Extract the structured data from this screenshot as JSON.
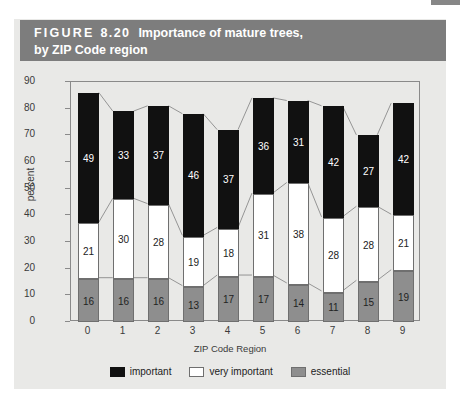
{
  "page_marker": {
    "name": "page-edge-marker",
    "color": "#878787"
  },
  "figure": {
    "label": "FIGURE",
    "number": "8.20",
    "title_line1": "Importance of mature trees,",
    "title_line2": "by ZIP Code region",
    "header_bg": "#7d7d7d",
    "panel_bg": "#e9e9e7"
  },
  "chart_data": {
    "type": "bar",
    "subtype": "stacked-vertical",
    "title": "Importance of mature trees, by ZIP Code region",
    "xlabel": "ZIP Code Region",
    "ylabel": "percent",
    "categories": [
      "0",
      "1",
      "2",
      "3",
      "4",
      "5",
      "6",
      "7",
      "8",
      "9"
    ],
    "ylim": [
      0,
      90
    ],
    "yticks": [
      0,
      10,
      20,
      30,
      40,
      50,
      60,
      70,
      80,
      90
    ],
    "grid": false,
    "legend_position": "bottom",
    "stack_order_bottom_to_top": [
      "essential",
      "very important",
      "important"
    ],
    "series": [
      {
        "name": "essential",
        "color": "#8e8e8e",
        "values": [
          16,
          16,
          16,
          13,
          17,
          17,
          14,
          11,
          15,
          19
        ]
      },
      {
        "name": "very important",
        "color": "#ffffff",
        "values": [
          21,
          30,
          28,
          19,
          18,
          31,
          38,
          28,
          28,
          21
        ]
      },
      {
        "name": "important",
        "color": "#111111",
        "values": [
          49,
          33,
          37,
          46,
          37,
          36,
          31,
          42,
          27,
          42
        ]
      }
    ],
    "totals": [
      86,
      79,
      81,
      78,
      72,
      84,
      83,
      81,
      70,
      82
    ],
    "legend": [
      {
        "label": "important",
        "swatch": "important"
      },
      {
        "label": "very important",
        "swatch": "very"
      },
      {
        "label": "essential",
        "swatch": "essential"
      }
    ]
  }
}
